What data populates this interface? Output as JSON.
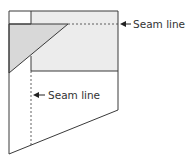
{
  "diagram": {
    "labels": {
      "top_seam": "Seam line",
      "middle_seam": "Seam line"
    },
    "colors": {
      "stroke": "#3a3a3a",
      "light_fill": "#ececec",
      "triangle_fill": "#d8d8d8",
      "background": "#ffffff"
    },
    "icons": {
      "arrow": "left-arrow-icon"
    }
  }
}
